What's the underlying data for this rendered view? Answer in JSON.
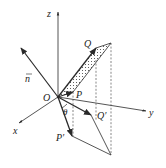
{
  "diagram": {
    "colors": {
      "stroke": "#2a2a2a",
      "dashed": "#555555",
      "fill_dots": "#444444",
      "background": "#ffffff"
    },
    "labels": {
      "z": "z",
      "y": "y",
      "x": "x",
      "n": "n",
      "O": "O",
      "P": "P",
      "Q": "Q",
      "P_prime": "P′",
      "Q_prime": "Q′",
      "theta": "θ"
    }
  }
}
